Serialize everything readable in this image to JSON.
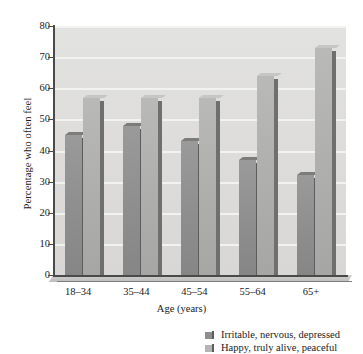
{
  "chart_data": {
    "type": "bar",
    "title": "",
    "xlabel": "Age (years)",
    "ylabel": "Percentage who often feel",
    "categories": [
      "18–34",
      "35–44",
      "45–54",
      "55–64",
      "65+"
    ],
    "series": [
      {
        "name": "Irritable, nervous, depressed",
        "color": "#8e8e8e",
        "values": [
          45,
          48,
          43,
          37,
          32
        ]
      },
      {
        "name": "Happy, truly alive, peaceful",
        "color": "#b4b4b2",
        "values": [
          57,
          57,
          57,
          64,
          73
        ]
      }
    ],
    "ylim": [
      0,
      80
    ],
    "yticks": [
      0,
      10,
      20,
      30,
      40,
      50,
      60,
      70,
      80
    ],
    "ytick_labels": [
      "0",
      "10",
      "20",
      "30",
      "40",
      "50",
      "60",
      "70",
      "80"
    ],
    "grid": true,
    "grid_axis": "y",
    "legend_position": "bottom-right",
    "plot_background": "#dedddb",
    "gridline_color": "#f2f2f0",
    "axis_color": "#4a4a4a"
  },
  "legend": {
    "entries": [
      {
        "label": "Irritable, nervous, depressed",
        "swatch": "dark"
      },
      {
        "label": "Happy, truly alive, peaceful",
        "swatch": "light"
      }
    ]
  }
}
